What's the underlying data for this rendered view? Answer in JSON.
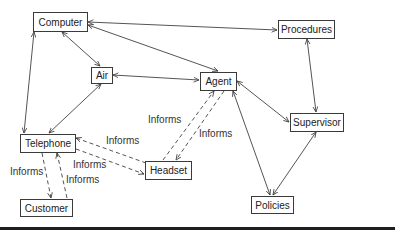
{
  "diagram": {
    "nodes": [
      {
        "id": "computer",
        "label": "Computer"
      },
      {
        "id": "procedures",
        "label": "Procedures"
      },
      {
        "id": "air",
        "label": "Air"
      },
      {
        "id": "agent",
        "label": "Agent"
      },
      {
        "id": "supervisor",
        "label": "Supervisor"
      },
      {
        "id": "telephone",
        "label": "Telephone"
      },
      {
        "id": "headset",
        "label": "Headset"
      },
      {
        "id": "customer",
        "label": "Customer"
      },
      {
        "id": "policies",
        "label": "Policies"
      }
    ],
    "edges": [
      {
        "from": "computer",
        "to": "procedures",
        "style": "solid",
        "arrows": "both"
      },
      {
        "from": "computer",
        "to": "agent",
        "style": "solid",
        "arrows": "both"
      },
      {
        "from": "computer",
        "to": "air",
        "style": "solid",
        "arrows": "both"
      },
      {
        "from": "computer",
        "to": "telephone",
        "style": "solid",
        "arrows": "both"
      },
      {
        "from": "air",
        "to": "agent",
        "style": "solid",
        "arrows": "both"
      },
      {
        "from": "air",
        "to": "telephone",
        "style": "solid",
        "arrows": "both"
      },
      {
        "from": "agent",
        "to": "supervisor",
        "style": "solid",
        "arrows": "both"
      },
      {
        "from": "agent",
        "to": "policies",
        "style": "solid",
        "arrows": "both"
      },
      {
        "from": "procedures",
        "to": "supervisor",
        "style": "solid",
        "arrows": "both"
      },
      {
        "from": "supervisor",
        "to": "policies",
        "style": "solid",
        "arrows": "both"
      },
      {
        "from": "headset",
        "to": "agent",
        "style": "dashed",
        "label": "Informs"
      },
      {
        "from": "agent",
        "to": "headset",
        "style": "dashed",
        "label": "Informs"
      },
      {
        "from": "headset",
        "to": "telephone",
        "style": "dashed",
        "label": "Informs"
      },
      {
        "from": "telephone",
        "to": "headset",
        "style": "dashed",
        "label": "Informs"
      },
      {
        "from": "telephone",
        "to": "customer",
        "style": "dashed",
        "label": "Informs"
      },
      {
        "from": "customer",
        "to": "telephone",
        "style": "dashed",
        "label": "Informs"
      }
    ],
    "edge_labels": {
      "headset_agent": "Informs",
      "agent_headset": "Informs",
      "headset_telephone": "Informs",
      "telephone_headset": "Informs",
      "telephone_customer": "Informs",
      "customer_telephone": "Informs"
    }
  }
}
